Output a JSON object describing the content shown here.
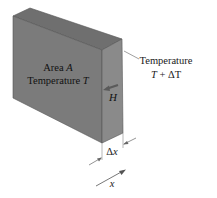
{
  "diagram": {
    "type": "heat-conduction-slab",
    "front_face_label_line1": "Area A",
    "front_face_label_line2": "Temperature T",
    "right_label_line1": "Temperature",
    "right_label_line2": "T + ΔT",
    "heat_flow_label": "H",
    "thickness_label": "Δx",
    "axis_label": "x",
    "colors": {
      "front_face": "#7b7b7b",
      "side_face": "#8a8a8a",
      "top_face": "#6f6f6f",
      "edge": "#555555",
      "leader_line": "#777777"
    }
  }
}
